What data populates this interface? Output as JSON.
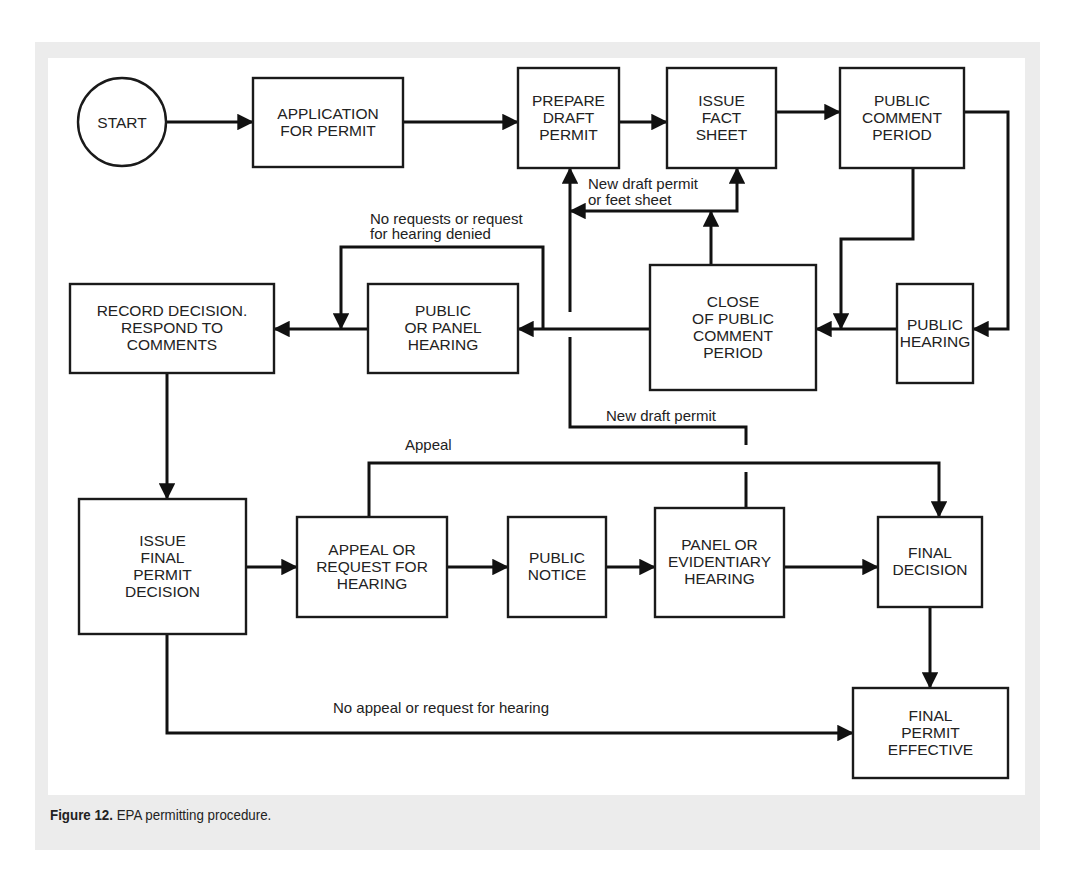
{
  "figure": {
    "caption_label": "Figure 12.",
    "caption_text": " EPA permitting procedure.",
    "colors": {
      "frame_bg": "#ececec",
      "canvas_bg": "#ffffff",
      "stroke": "#111111",
      "text": "#222222"
    }
  },
  "diagram": {
    "start": {
      "id": "start",
      "label": "START",
      "cx": 122,
      "cy": 122,
      "r": 44
    },
    "nodes": [
      {
        "id": "application",
        "lines": [
          "APPLICATION",
          "FOR PERMIT"
        ],
        "x": 253,
        "y": 78,
        "w": 150,
        "h": 89
      },
      {
        "id": "prepare-draft",
        "lines": [
          "PREPARE",
          "DRAFT",
          "PERMIT"
        ],
        "x": 518,
        "y": 68,
        "w": 101,
        "h": 100
      },
      {
        "id": "issue-fact-sheet",
        "lines": [
          "ISSUE",
          "FACT",
          "SHEET"
        ],
        "x": 667,
        "y": 68,
        "w": 109,
        "h": 100
      },
      {
        "id": "public-comment-period",
        "lines": [
          "PUBLIC",
          "COMMENT",
          "PERIOD"
        ],
        "x": 840,
        "y": 68,
        "w": 124,
        "h": 100
      },
      {
        "id": "record-decision",
        "lines": [
          "RECORD DECISION.",
          "RESPOND TO",
          "COMMENTS"
        ],
        "x": 70,
        "y": 284,
        "w": 204,
        "h": 89
      },
      {
        "id": "public-or-panel-hearing",
        "lines": [
          "PUBLIC",
          "OR PANEL",
          "HEARING"
        ],
        "x": 368,
        "y": 284,
        "w": 150,
        "h": 89
      },
      {
        "id": "close-comment-period",
        "lines": [
          "CLOSE",
          "OF PUBLIC",
          "COMMENT",
          "PERIOD"
        ],
        "x": 650,
        "y": 265,
        "w": 166,
        "h": 125
      },
      {
        "id": "public-hearing",
        "lines": [
          "PUBLIC",
          "HEARING"
        ],
        "x": 897,
        "y": 284,
        "w": 76,
        "h": 99
      },
      {
        "id": "issue-final-decision",
        "lines": [
          "ISSUE",
          "FINAL",
          "PERMIT",
          "DECISION"
        ],
        "x": 79,
        "y": 499,
        "w": 167,
        "h": 135
      },
      {
        "id": "appeal-or-request",
        "lines": [
          "APPEAL OR",
          "REQUEST FOR",
          "HEARING"
        ],
        "x": 297,
        "y": 517,
        "w": 150,
        "h": 100
      },
      {
        "id": "public-notice",
        "lines": [
          "PUBLIC",
          "NOTICE"
        ],
        "x": 508,
        "y": 517,
        "w": 98,
        "h": 100
      },
      {
        "id": "panel-or-evidentiary",
        "lines": [
          "PANEL OR",
          "EVIDENTIARY",
          "HEARING"
        ],
        "x": 655,
        "y": 508,
        "w": 129,
        "h": 109
      },
      {
        "id": "final-decision",
        "lines": [
          "FINAL",
          "DECISION"
        ],
        "x": 878,
        "y": 517,
        "w": 104,
        "h": 90
      },
      {
        "id": "final-permit-effective",
        "lines": [
          "FINAL",
          "PERMIT",
          "EFFECTIVE"
        ],
        "x": 853,
        "y": 688,
        "w": 155,
        "h": 90
      }
    ],
    "edges": [
      {
        "id": "start-to-application",
        "points": [
          [
            166,
            122
          ],
          [
            253,
            122
          ]
        ],
        "arrow": true
      },
      {
        "id": "application-to-prepare",
        "points": [
          [
            403,
            122
          ],
          [
            518,
            122
          ]
        ],
        "arrow": true
      },
      {
        "id": "prepare-to-fact-sheet",
        "points": [
          [
            619,
            122
          ],
          [
            667,
            122
          ]
        ],
        "arrow": true
      },
      {
        "id": "fact-sheet-to-comment",
        "points": [
          [
            776,
            112
          ],
          [
            840,
            112
          ]
        ],
        "arrow": true
      },
      {
        "id": "comment-to-public-hearing",
        "points": [
          [
            964,
            112
          ],
          [
            1008,
            112
          ],
          [
            1008,
            329
          ],
          [
            973,
            329
          ]
        ],
        "arrow": true
      },
      {
        "id": "comment-to-close",
        "points": [
          [
            913,
            168
          ],
          [
            913,
            239
          ],
          [
            841,
            239
          ],
          [
            841,
            329
          ]
        ],
        "arrow": true
      },
      {
        "id": "public-hearing-to-close",
        "points": [
          [
            897,
            329
          ],
          [
            816,
            329
          ]
        ],
        "arrow": true
      },
      {
        "id": "close-to-fact-sheet-branch",
        "points": [
          [
            711,
            265
          ],
          [
            711,
            211
          ]
        ],
        "arrow": true
      },
      {
        "id": "branch-to-fact-sheet",
        "points": [
          [
            711,
            211
          ],
          [
            737,
            211
          ],
          [
            737,
            168
          ]
        ],
        "arrow": true
      },
      {
        "id": "branch-to-prepare-left",
        "points": [
          [
            711,
            211
          ],
          [
            570,
            211
          ]
        ],
        "arrow": true
      },
      {
        "id": "new-draft-up-to-prepare",
        "points": [
          [
            570,
            312
          ],
          [
            570,
            168
          ]
        ],
        "arrow": true
      },
      {
        "id": "close-to-panel-hearing",
        "points": [
          [
            650,
            329
          ],
          [
            518,
            329
          ]
        ],
        "arrow": true
      },
      {
        "id": "no-requests-loop",
        "points": [
          [
            543,
            329
          ],
          [
            543,
            247
          ],
          [
            341,
            247
          ],
          [
            341,
            329
          ]
        ],
        "arrow": true
      },
      {
        "id": "panel-hearing-to-record",
        "points": [
          [
            368,
            329
          ],
          [
            274,
            329
          ]
        ],
        "arrow": true
      },
      {
        "id": "record-to-issue-final",
        "points": [
          [
            167,
            373
          ],
          [
            167,
            499
          ]
        ],
        "arrow": true
      },
      {
        "id": "new-draft-from-evidentiary",
        "points": [
          [
            570,
            337
          ],
          [
            570,
            427
          ],
          [
            746,
            427
          ],
          [
            746,
            445
          ]
        ],
        "arrow": false
      },
      {
        "id": "new-draft-evidentiary-stub",
        "points": [
          [
            746,
            472
          ],
          [
            746,
            508
          ]
        ],
        "arrow": false
      },
      {
        "id": "issue-final-to-appeal",
        "points": [
          [
            246,
            567
          ],
          [
            297,
            567
          ]
        ],
        "arrow": true
      },
      {
        "id": "appeal-to-notice",
        "points": [
          [
            447,
            567
          ],
          [
            508,
            567
          ]
        ],
        "arrow": true
      },
      {
        "id": "notice-to-panel",
        "points": [
          [
            606,
            567
          ],
          [
            655,
            567
          ]
        ],
        "arrow": true
      },
      {
        "id": "panel-to-final-decision",
        "points": [
          [
            784,
            567
          ],
          [
            878,
            567
          ]
        ],
        "arrow": true
      },
      {
        "id": "appeal-bypass",
        "points": [
          [
            369,
            517
          ],
          [
            369,
            463
          ],
          [
            939,
            463
          ],
          [
            939,
            517
          ]
        ],
        "arrow": true
      },
      {
        "id": "final-decision-to-effective",
        "points": [
          [
            930,
            607
          ],
          [
            930,
            688
          ]
        ],
        "arrow": true
      },
      {
        "id": "no-appeal-to-effective",
        "points": [
          [
            167,
            634
          ],
          [
            167,
            733
          ],
          [
            853,
            733
          ]
        ],
        "arrow": true
      }
    ],
    "edge_labels": [
      {
        "id": "label-new-draft-or-fact-sheet",
        "lines": [
          "New draft permit",
          "or feet sheet"
        ],
        "x": 588,
        "y": 189,
        "lh": 16
      },
      {
        "id": "label-no-requests",
        "lines": [
          "No requests or request",
          "for hearing denied"
        ],
        "x": 370,
        "y": 224,
        "lh": 15
      },
      {
        "id": "label-new-draft-permit",
        "lines": [
          "New draft permit"
        ],
        "x": 606,
        "y": 421,
        "lh": 16
      },
      {
        "id": "label-appeal",
        "lines": [
          "Appeal"
        ],
        "x": 405,
        "y": 450,
        "lh": 16
      },
      {
        "id": "label-no-appeal",
        "lines": [
          "No appeal or request for hearing"
        ],
        "x": 333,
        "y": 713,
        "lh": 16
      }
    ]
  }
}
